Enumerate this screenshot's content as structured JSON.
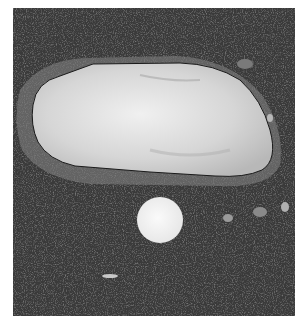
{
  "image": {
    "description": "Grayscale photograph of a large pale elongated pebble embedded in dark speckled gravel/aggregate, with a round white coin below it for scale",
    "colors": {
      "border": "#ffffff",
      "ground": "#3a3a3a",
      "stone": "#d8d8d8",
      "coin": "#f2f2f2",
      "halo": "#8a8a8a"
    }
  }
}
